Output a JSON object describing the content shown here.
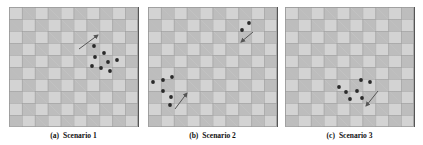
{
  "figure": {
    "colors": {
      "cell_light": "#d3d3d3",
      "cell_dark": "#bdbdbd",
      "dot": "#2a2a2a",
      "arrow": "#555555"
    },
    "grid": {
      "cols": 10,
      "rows": 10
    },
    "panels": [
      {
        "tag": "(a)",
        "title": "Scenario 1",
        "caption": "(a) Scenario 1",
        "dots": [
          [
            85,
            39
          ],
          [
            86,
            50
          ],
          [
            95,
            46
          ],
          [
            83,
            59
          ],
          [
            92,
            61
          ],
          [
            99,
            55
          ],
          [
            108,
            53
          ],
          [
            101,
            64
          ]
        ],
        "arrows": [
          {
            "from": [
              70,
              42
            ],
            "to": [
              89,
              28
            ]
          }
        ]
      },
      {
        "tag": "(b)",
        "title": "Scenario 2",
        "caption": "(b) Scenario 2",
        "dots": [
          [
            101,
            16
          ],
          [
            94,
            23
          ],
          [
            5,
            75
          ],
          [
            15,
            73
          ],
          [
            24,
            70
          ],
          [
            15,
            84
          ],
          [
            23,
            90
          ],
          [
            22,
            98
          ]
        ],
        "arrows": [
          {
            "from": [
              105,
              25
            ],
            "to": [
              93,
              35
            ]
          },
          {
            "from": [
              27,
              102
            ],
            "to": [
              39,
              86
            ]
          }
        ]
      },
      {
        "tag": "(c)",
        "title": "Scenario 3",
        "caption": "(c) Scenario 3",
        "dots": [
          [
            54,
            80
          ],
          [
            76,
            73
          ],
          [
            85,
            75
          ],
          [
            61,
            85
          ],
          [
            72,
            84
          ],
          [
            65,
            92
          ],
          [
            77,
            91
          ]
        ],
        "arrows": [
          {
            "from": [
              93,
              84
            ],
            "to": [
              81,
              99
            ]
          }
        ]
      }
    ]
  }
}
